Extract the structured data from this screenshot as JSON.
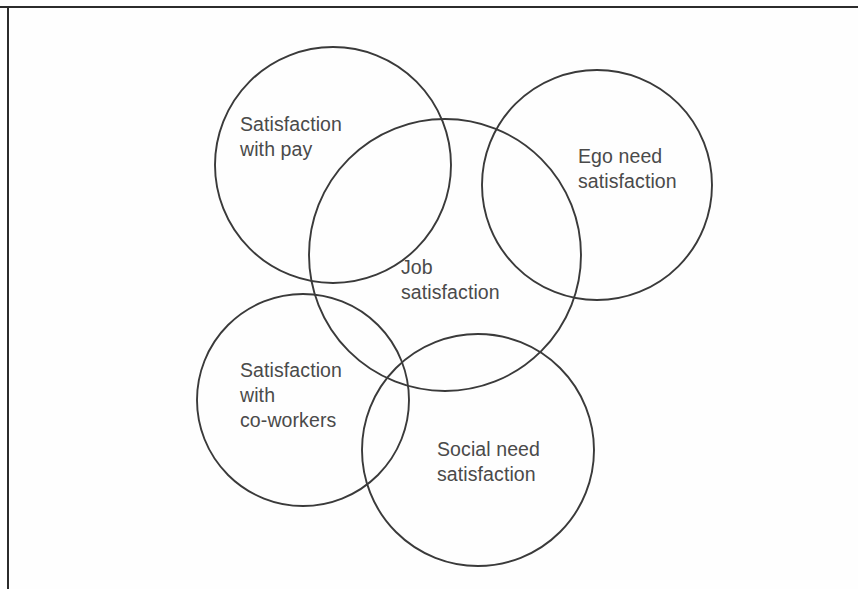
{
  "figure": {
    "kind": "venn-diagram",
    "stroke_color": "#3a3a3a",
    "text_color": "#4a4a4a",
    "background_color": "#fefefe",
    "frame_color": "#2b2b2b"
  },
  "chart_data": {
    "type": "diagram",
    "diagram_type": "venn",
    "title": "",
    "sets": [
      {
        "id": "pay",
        "label": "Satisfaction\nwith pay",
        "label_line_1": "Satisfaction",
        "label_line_2": "with pay",
        "cx": 333,
        "cy": 165,
        "r": 118
      },
      {
        "id": "ego",
        "label": "Ego need\nsatisfaction",
        "label_line_1": "Ego need",
        "label_line_2": "satisfaction",
        "cx": 597,
        "cy": 185,
        "r": 115
      },
      {
        "id": "job",
        "label": "Job\nsatisfaction",
        "label_line_1": "Job",
        "label_line_2": "satisfaction",
        "cx": 445,
        "cy": 255,
        "r": 136
      },
      {
        "id": "coworkers",
        "label": "Satisfaction\nwith\nco-workers",
        "label_line_1": "Satisfaction",
        "label_line_2": "with",
        "label_line_3": "co-workers",
        "cx": 303,
        "cy": 400,
        "r": 106
      },
      {
        "id": "social",
        "label": "Social need\nsatisfaction",
        "label_line_1": "Social need",
        "label_line_2": "satisfaction",
        "cx": 478,
        "cy": 450,
        "r": 116
      }
    ],
    "overlaps": [
      [
        "job",
        "pay"
      ],
      [
        "job",
        "ego"
      ],
      [
        "job",
        "coworkers"
      ],
      [
        "job",
        "social"
      ],
      [
        "pay",
        "coworkers"
      ],
      [
        "ego",
        "social"
      ],
      [
        "coworkers",
        "social"
      ]
    ]
  }
}
